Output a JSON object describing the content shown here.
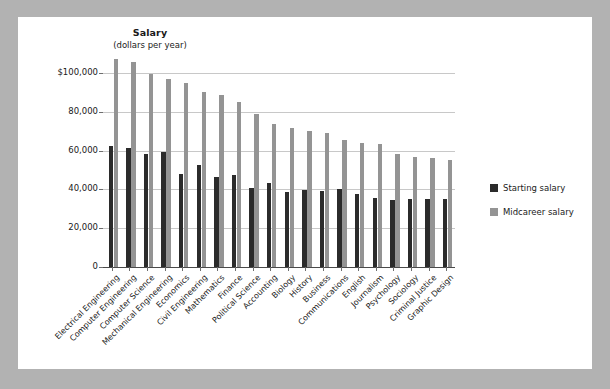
{
  "chart_data": {
    "type": "bar",
    "title": "Salary",
    "subtitle": "(dollars per year)",
    "xlabel": "",
    "ylabel": "Salary (dollars per year)",
    "ylim": [
      0,
      110000
    ],
    "grid": true,
    "legend_position": "right",
    "ytick_labels": [
      "$100,000",
      "80,000",
      "60,000",
      "40,000",
      "20,000",
      "0"
    ],
    "ytick_values": [
      100000,
      80000,
      60000,
      40000,
      20000,
      0
    ],
    "categories": [
      "Electrical Engineering",
      "Computer Engineering",
      "Computer Science",
      "Mechanical Engineering",
      "Economics",
      "Civil Engineering",
      "Mathematics",
      "Finance",
      "Political Science",
      "Accounting",
      "Biology",
      "History",
      "Business",
      "Communications",
      "English",
      "Journalism",
      "Psychology",
      "Sociology",
      "Criminal Justice",
      "Graphic Design"
    ],
    "series": [
      {
        "name": "Starting salary",
        "color": "#2b2b2b",
        "values": [
          62500,
          61500,
          58500,
          59500,
          48000,
          52500,
          46500,
          47500,
          40500,
          43500,
          38500,
          39500,
          39000,
          40000,
          37500,
          35500,
          34500,
          35000,
          35000,
          35000
        ]
      },
      {
        "name": "Midcareer salary",
        "color": "#949494",
        "values": [
          107000,
          105500,
          99500,
          97000,
          95000,
          90000,
          88500,
          85000,
          79000,
          73500,
          71500,
          70000,
          69000,
          65500,
          64000,
          63500,
          58000,
          56500,
          56000,
          55000
        ]
      }
    ]
  },
  "legend": {
    "items": [
      {
        "label": "Starting salary",
        "color": "#2b2b2b"
      },
      {
        "label": "Midcareer salary",
        "color": "#949494"
      }
    ]
  }
}
